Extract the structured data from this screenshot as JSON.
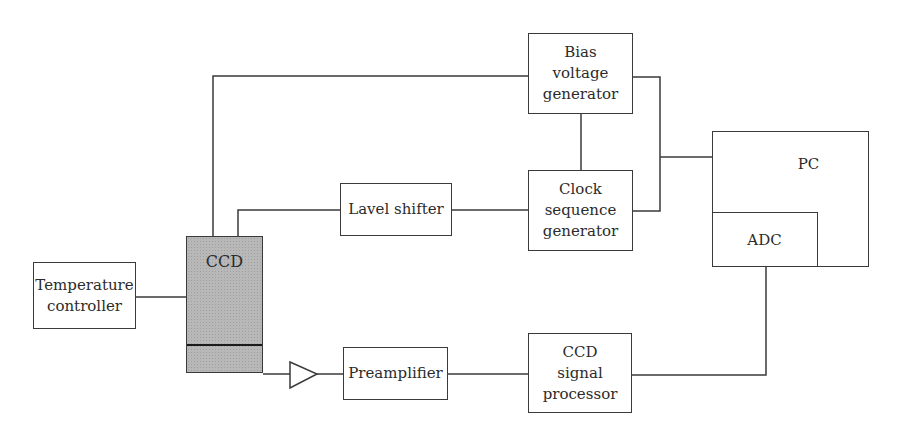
{
  "diagram": {
    "type": "block-diagram",
    "blocks": {
      "bias": {
        "label": "Bias\nvoltage\ngenerator"
      },
      "clock": {
        "label": "Clock\nsequence\ngenerator"
      },
      "shifter": {
        "label": "Lavel shifter"
      },
      "pc": {
        "label": "PC"
      },
      "adc": {
        "label": "ADC"
      },
      "temp": {
        "label": "Temperature\ncontroller"
      },
      "ccd": {
        "label": "CCD"
      },
      "preamp": {
        "label": "Preamplifier"
      },
      "processor": {
        "label": "CCD\nsignal\nprocessor"
      }
    },
    "connections": [
      [
        "CCD",
        "Bias voltage generator"
      ],
      [
        "CCD",
        "Lavel shifter"
      ],
      [
        "Lavel shifter",
        "Clock sequence generator"
      ],
      [
        "Bias voltage generator",
        "Clock sequence generator"
      ],
      [
        "Bias voltage generator",
        "PC"
      ],
      [
        "Clock sequence generator",
        "PC"
      ],
      [
        "Temperature controller",
        "CCD"
      ],
      [
        "CCD",
        "Amplifier"
      ],
      [
        "Amplifier",
        "Preamplifier"
      ],
      [
        "Preamplifier",
        "CCD signal processor"
      ],
      [
        "CCD signal processor",
        "ADC"
      ]
    ],
    "colors": {
      "line": "#3a3a3a",
      "ccd_fill": "#b8b8b8",
      "text": "#2b2b2b"
    }
  }
}
